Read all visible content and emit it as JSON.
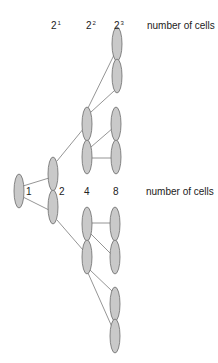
{
  "diagram": {
    "colors": {
      "cell_fill": "#c9c9c9",
      "cell_stroke": "#6b6b6b",
      "line": "#7a7a7a",
      "text": "#222222"
    },
    "top_row": {
      "powers": [
        {
          "base": "2",
          "exp": "1"
        },
        {
          "base": "2",
          "exp": "2"
        },
        {
          "base": "2",
          "exp": "3"
        }
      ],
      "label": "number of cells"
    },
    "middle_row": {
      "counts": [
        "1",
        "2",
        "4",
        "8"
      ],
      "label": "number of cells"
    },
    "generations": [
      {
        "count": 1,
        "cells": [
          {
            "cx": 19,
            "cy": 191
          }
        ]
      },
      {
        "count": 2,
        "cells": [
          {
            "cx": 53,
            "cy": 174
          },
          {
            "cx": 53,
            "cy": 207
          }
        ]
      },
      {
        "count": 4,
        "cells": [
          {
            "cx": 87,
            "cy": 124
          },
          {
            "cx": 87,
            "cy": 157
          },
          {
            "cx": 87,
            "cy": 224
          },
          {
            "cx": 87,
            "cy": 257
          }
        ]
      },
      {
        "count": 8,
        "cells": [
          {
            "cx": 117,
            "cy": 44
          },
          {
            "cx": 117,
            "cy": 76
          },
          {
            "cx": 116,
            "cy": 124
          },
          {
            "cx": 116,
            "cy": 157
          },
          {
            "cx": 115,
            "cy": 224
          },
          {
            "cx": 115,
            "cy": 257
          },
          {
            "cx": 115,
            "cy": 304
          },
          {
            "cx": 115,
            "cy": 336
          }
        ]
      }
    ]
  }
}
